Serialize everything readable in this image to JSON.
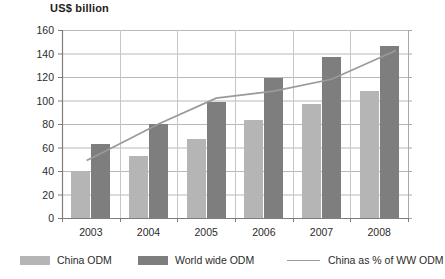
{
  "chart_data": {
    "type": "bar",
    "title": "US$ billion",
    "xlabel": "",
    "ylabel": "",
    "ylim": [
      0,
      160
    ],
    "ytick_step": 20,
    "yticks": [
      0,
      20,
      40,
      60,
      80,
      100,
      120,
      140,
      160
    ],
    "grid": true,
    "legend_position": "bottom",
    "categories": [
      "2003",
      "2004",
      "2005",
      "2006",
      "2007",
      "2008"
    ],
    "series": [
      {
        "name": "China ODM",
        "type": "bar",
        "color": "#b5b5b5",
        "values": [
          40,
          53,
          67,
          83,
          97,
          108
        ]
      },
      {
        "name": "World wide ODM",
        "type": "bar",
        "color": "#7e7e7e",
        "values": [
          63,
          80,
          99,
          119,
          137,
          146
        ]
      },
      {
        "name": "China as % of WW ODM",
        "type": "line",
        "color": "#9a9a9a",
        "axis": "secondary-implied",
        "values": [
          55,
          80,
          102,
          108,
          118,
          140
        ]
      }
    ],
    "legend": [
      {
        "label": "China ODM",
        "marker": "square",
        "color": "#b5b5b5"
      },
      {
        "label": "World wide ODM",
        "marker": "square",
        "color": "#7e7e7e"
      },
      {
        "label": "China as % of WW ODM",
        "marker": "line",
        "color": "#9a9a9a"
      }
    ]
  }
}
